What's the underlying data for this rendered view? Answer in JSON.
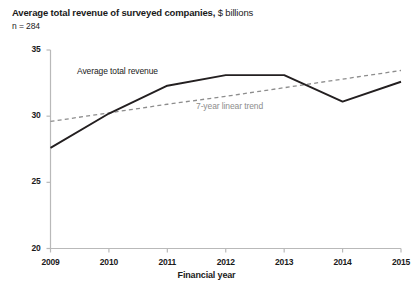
{
  "figure": {
    "title_main": "Average total revenue of surveyed companies,",
    "title_unit": " $ billions",
    "sample_size": "n = 284"
  },
  "chart_data": {
    "type": "line",
    "title": "Average total revenue of surveyed companies, $ billions",
    "subtitle": "n = 284",
    "xlabel": "Financial year",
    "ylabel": "",
    "categories": [
      "2009",
      "2010",
      "2011",
      "2012",
      "2013",
      "2014",
      "2015"
    ],
    "x": [
      2009,
      2010,
      2011,
      2012,
      2013,
      2014,
      2015
    ],
    "xlim": [
      2009,
      2015
    ],
    "ylim": [
      20,
      35
    ],
    "yticks": [
      "20",
      "25",
      "30",
      "35"
    ],
    "ytick_values": [
      20,
      25,
      30,
      35
    ],
    "grid": false,
    "legend_position": "inline-annotation",
    "series": [
      {
        "name": "Average total revenue",
        "style": "solid",
        "color": "#231f20",
        "values": [
          27.6,
          30.2,
          32.3,
          33.1,
          33.1,
          31.1,
          32.6
        ]
      },
      {
        "name": "7-year linear trend",
        "style": "dashed",
        "color": "#8d8d8d",
        "values": [
          29.6,
          30.25,
          30.9,
          31.5,
          32.15,
          32.8,
          33.45
        ]
      }
    ],
    "annotations": [
      {
        "text": "Average total revenue",
        "color": "#1a1a1a"
      },
      {
        "text": "7-year linear trend",
        "color": "#8d8d8d"
      }
    ]
  },
  "colors": {
    "series_line": "#231f20",
    "trend_line": "#8d8d8d",
    "axis": "#b9b9b9",
    "text": "#1a1a1a"
  }
}
